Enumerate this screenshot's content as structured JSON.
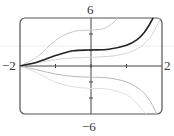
{
  "chart_data": {
    "type": "line",
    "title": "",
    "xlabel": "",
    "ylabel": "",
    "xlim": [
      -2,
      2
    ],
    "ylim": [
      -6,
      6
    ],
    "x_ticks": [
      -1,
      0,
      1
    ],
    "y_ticks": [
      -4,
      -2,
      2,
      4
    ],
    "tick_labels": {
      "x_min": "−2",
      "x_max": "2",
      "y_max": "6",
      "y_min": "−6"
    },
    "grid": false,
    "legend": null,
    "series": [
      {
        "name": "highlighted solution",
        "color": "#222222",
        "width": 1.6,
        "x": [
          -2,
          -1.5,
          -1,
          -0.5,
          0,
          0.5,
          1,
          1.3,
          1.5,
          1.65,
          1.75
        ],
        "y": [
          0,
          0.5,
          1.3,
          1.9,
          2.0,
          2.1,
          2.6,
          3.3,
          4.2,
          5.2,
          6
        ]
      },
      {
        "name": "upper solution",
        "color": "#c8c8c8",
        "width": 1.0,
        "x": [
          -2,
          -1.5,
          -1,
          -0.5,
          0,
          0.3,
          0.5,
          0.65,
          0.75
        ],
        "y": [
          0,
          1.2,
          3.2,
          4.3,
          4.5,
          4.6,
          5.0,
          5.5,
          6
        ]
      },
      {
        "name": "middle solution",
        "color": "#d4d4d4",
        "width": 1.0,
        "x": [
          -2,
          -1.5,
          -1,
          -0.5,
          0,
          0.5,
          1,
          1.4,
          1.7,
          1.85,
          1.95
        ],
        "y": [
          0,
          0.4,
          0.8,
          1.0,
          1.1,
          1.2,
          1.6,
          2.4,
          3.8,
          5.0,
          6
        ]
      },
      {
        "name": "lower solution",
        "color": "#b8b8b8",
        "width": 1.0,
        "x": [
          -2,
          -1.5,
          -1,
          -0.5,
          0,
          0.5,
          1,
          1.4,
          1.65,
          1.8,
          1.85
        ],
        "y": [
          0,
          -0.5,
          -1.0,
          -1.3,
          -1.4,
          -1.5,
          -2.0,
          -3.0,
          -4.3,
          -5.5,
          -6
        ]
      },
      {
        "name": "lowest solution",
        "color": "#e0e0e0",
        "width": 1.0,
        "x": [
          -2,
          -1.5,
          -1,
          -0.5,
          0,
          0.5,
          1,
          1.25,
          1.45,
          1.55
        ],
        "y": [
          0,
          -0.9,
          -2.0,
          -2.6,
          -2.8,
          -2.9,
          -3.6,
          -4.5,
          -5.5,
          -6
        ]
      }
    ]
  },
  "labels": {
    "x_min": "−2",
    "x_max": "2",
    "y_max": "6",
    "y_min": "−6"
  }
}
